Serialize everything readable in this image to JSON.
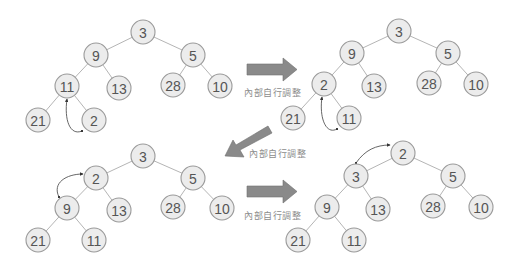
{
  "diagram": {
    "title": "",
    "type": "min-heap-sift-up",
    "step_label": "內部自行調整",
    "colors": {
      "node_fill": "#ececec",
      "node_stroke": "#9a9a9a",
      "node_text": "#555555",
      "edge": "#b5b5b5",
      "arrow": "#8a8a8a",
      "label": "#8c8c8c"
    },
    "trees": [
      {
        "id": "step1",
        "nodes": [
          {
            "id": "a",
            "value": "3",
            "x": 143,
            "y": 32
          },
          {
            "id": "b",
            "value": "9",
            "x": 96,
            "y": 55
          },
          {
            "id": "c",
            "value": "5",
            "x": 193,
            "y": 55
          },
          {
            "id": "d",
            "value": "11",
            "x": 67,
            "y": 86
          },
          {
            "id": "e",
            "value": "13",
            "x": 119,
            "y": 88
          },
          {
            "id": "f",
            "value": "28",
            "x": 173,
            "y": 85
          },
          {
            "id": "g",
            "value": "10",
            "x": 220,
            "y": 86
          },
          {
            "id": "h",
            "value": "21",
            "x": 38,
            "y": 120
          },
          {
            "id": "i",
            "value": "2",
            "x": 94,
            "y": 120
          }
        ],
        "edges": [
          [
            "a",
            "b"
          ],
          [
            "a",
            "c"
          ],
          [
            "b",
            "d"
          ],
          [
            "b",
            "e"
          ],
          [
            "c",
            "f"
          ],
          [
            "c",
            "g"
          ],
          [
            "d",
            "h"
          ],
          [
            "d",
            "i"
          ]
        ],
        "swap": {
          "from": "i",
          "to": "d",
          "path": "M 82 131 C 70 136, 64 120, 67 99"
        }
      },
      {
        "id": "step2",
        "nodes": [
          {
            "id": "a",
            "value": "3",
            "x": 399,
            "y": 31
          },
          {
            "id": "b",
            "value": "9",
            "x": 352,
            "y": 53
          },
          {
            "id": "c",
            "value": "5",
            "x": 448,
            "y": 53
          },
          {
            "id": "d",
            "value": "2",
            "x": 324,
            "y": 84
          },
          {
            "id": "e",
            "value": "13",
            "x": 374,
            "y": 86
          },
          {
            "id": "f",
            "value": "28",
            "x": 429,
            "y": 83
          },
          {
            "id": "g",
            "value": "10",
            "x": 476,
            "y": 84
          },
          {
            "id": "h",
            "value": "21",
            "x": 293,
            "y": 118
          },
          {
            "id": "i",
            "value": "11",
            "x": 349,
            "y": 118
          }
        ],
        "edges": [
          [
            "a",
            "b"
          ],
          [
            "a",
            "c"
          ],
          [
            "b",
            "d"
          ],
          [
            "b",
            "e"
          ],
          [
            "c",
            "f"
          ],
          [
            "c",
            "g"
          ],
          [
            "d",
            "h"
          ],
          [
            "d",
            "i"
          ]
        ],
        "swap": {
          "from": "d",
          "to": "b",
          "path": "M 337 129 C 326 135, 319 118, 322 97"
        }
      },
      {
        "id": "step3",
        "nodes": [
          {
            "id": "a",
            "value": "3",
            "x": 143,
            "y": 156
          },
          {
            "id": "b",
            "value": "2",
            "x": 96,
            "y": 178
          },
          {
            "id": "c",
            "value": "5",
            "x": 193,
            "y": 178
          },
          {
            "id": "d",
            "value": "9",
            "x": 67,
            "y": 208
          },
          {
            "id": "e",
            "value": "13",
            "x": 119,
            "y": 210
          },
          {
            "id": "f",
            "value": "28",
            "x": 173,
            "y": 207
          },
          {
            "id": "g",
            "value": "10",
            "x": 222,
            "y": 208
          },
          {
            "id": "h",
            "value": "21",
            "x": 38,
            "y": 240
          },
          {
            "id": "i",
            "value": "11",
            "x": 94,
            "y": 240
          }
        ],
        "edges": [
          [
            "a",
            "b"
          ],
          [
            "a",
            "c"
          ],
          [
            "b",
            "d"
          ],
          [
            "b",
            "e"
          ],
          [
            "c",
            "f"
          ],
          [
            "c",
            "g"
          ],
          [
            "d",
            "h"
          ],
          [
            "d",
            "i"
          ]
        ],
        "swap": {
          "from": "d",
          "to": "b",
          "path": "M 59 197 C 52 183, 66 174, 83 174"
        }
      },
      {
        "id": "step4",
        "nodes": [
          {
            "id": "a",
            "value": "2",
            "x": 403,
            "y": 153
          },
          {
            "id": "b",
            "value": "3",
            "x": 356,
            "y": 176
          },
          {
            "id": "c",
            "value": "5",
            "x": 453,
            "y": 176
          },
          {
            "id": "d",
            "value": "9",
            "x": 327,
            "y": 207
          },
          {
            "id": "e",
            "value": "13",
            "x": 378,
            "y": 209
          },
          {
            "id": "f",
            "value": "28",
            "x": 433,
            "y": 206
          },
          {
            "id": "g",
            "value": "10",
            "x": 481,
            "y": 207
          },
          {
            "id": "h",
            "value": "21",
            "x": 298,
            "y": 240
          },
          {
            "id": "i",
            "value": "11",
            "x": 354,
            "y": 240
          }
        ],
        "edges": [
          [
            "a",
            "b"
          ],
          [
            "a",
            "c"
          ],
          [
            "b",
            "d"
          ],
          [
            "b",
            "e"
          ],
          [
            "c",
            "f"
          ],
          [
            "c",
            "g"
          ],
          [
            "d",
            "h"
          ],
          [
            "d",
            "i"
          ]
        ],
        "swap": {
          "from": "b",
          "to": "a",
          "path": "M 356 163 C 365 150, 376 145, 390 145"
        }
      }
    ],
    "transitions": [
      {
        "id": "t1",
        "direction": "right",
        "label": "內部自行調整",
        "label_x": 244,
        "label_y": 86
      },
      {
        "id": "t2",
        "direction": "down-left",
        "label": "內部自行調整",
        "label_x": 249,
        "label_y": 147
      },
      {
        "id": "t3",
        "direction": "right",
        "label": "內部自行調整",
        "label_x": 244,
        "label_y": 209
      }
    ]
  }
}
